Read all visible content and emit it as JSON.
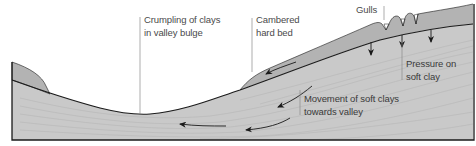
{
  "diagram": {
    "colors": {
      "soft_clay": "#c9c9c9",
      "hard_bed": "#b3b3b3",
      "outline": "#1a1a1a",
      "strata_line": "#b8b8b8",
      "leader_line": "#8a8a8a",
      "text": "#4a4a4a"
    },
    "labels": {
      "crumpling_line1": "Crumpling of clays",
      "crumpling_line2": "in valley bulge",
      "cambered_line1": "Cambered",
      "cambered_line2": "hard bed",
      "gulls": "Gulls",
      "pressure_line1": "Pressure on",
      "pressure_line2": "soft clay",
      "movement_line1": "Movement of soft clays",
      "movement_line2": "towards valley"
    },
    "arrows": [
      {
        "name": "hard-bed-slide-arrow",
        "direction": "down-left"
      },
      {
        "name": "clay-movement-arrow-1",
        "direction": "down-left"
      },
      {
        "name": "clay-movement-arrow-2",
        "direction": "left"
      },
      {
        "name": "clay-movement-arrow-3",
        "direction": "left"
      },
      {
        "name": "pressure-arrow-1",
        "direction": "down"
      },
      {
        "name": "pressure-arrow-2",
        "direction": "down"
      },
      {
        "name": "pressure-arrow-3",
        "direction": "down"
      }
    ]
  }
}
